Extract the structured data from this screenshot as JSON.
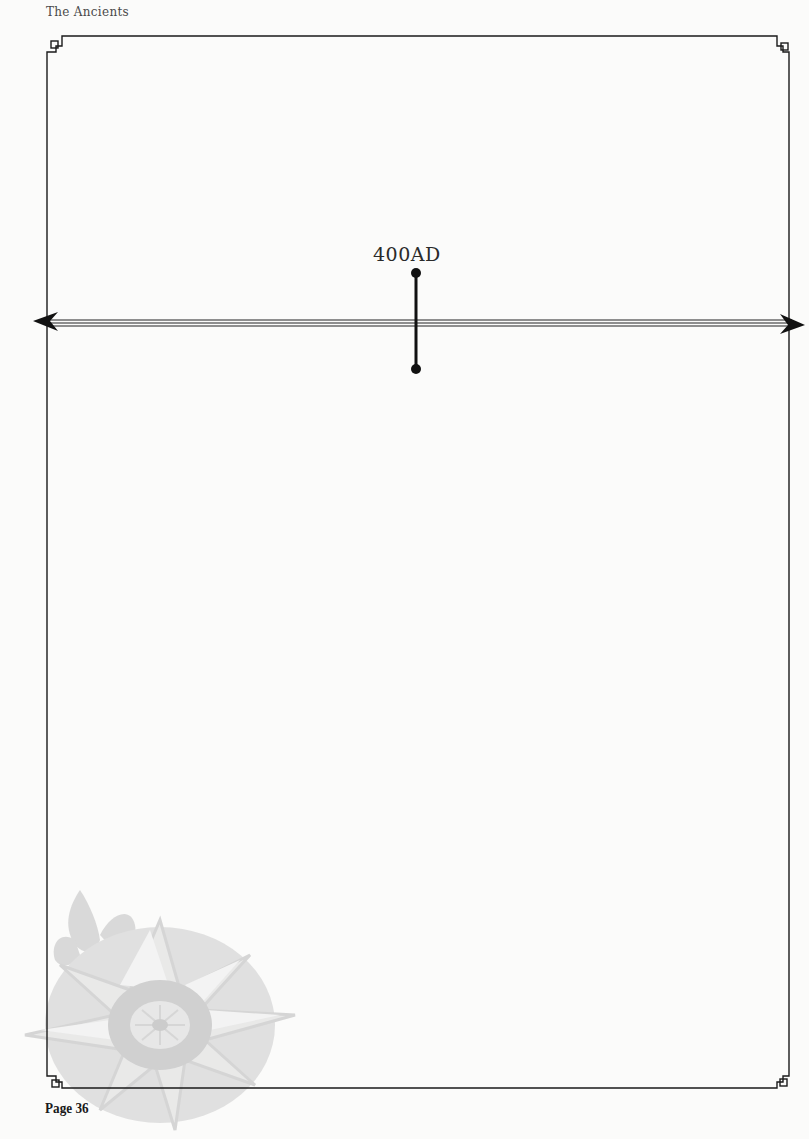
{
  "header": {
    "title": "The Ancients"
  },
  "footer": {
    "page_label": "Page 36"
  },
  "timeline": {
    "marker_label": "400AD",
    "arrow_left": "arrow-left",
    "arrow_right": "arrow-right"
  },
  "decoration": {
    "watermark": "compass-rose-fleur-de-lis",
    "watermark_color": "#d6d6d6"
  },
  "colors": {
    "frame": "#1a1a1a",
    "background": "#fbfbfa"
  }
}
